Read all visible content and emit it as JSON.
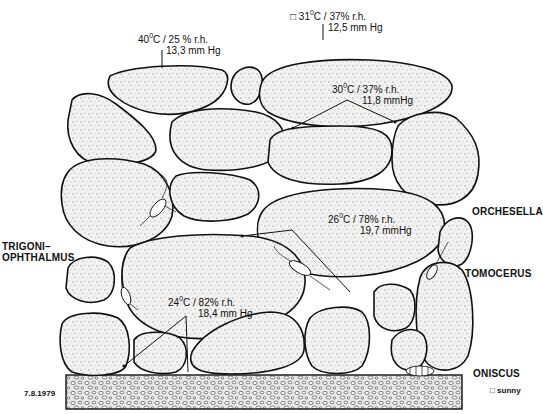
{
  "figure": {
    "type": "ecological cross-section illustration",
    "date_label": "7.8.1979",
    "legend": {
      "symbol": "□",
      "label": "sunny"
    }
  },
  "measurements": [
    {
      "id": "m1",
      "temp": "40",
      "unit": "C",
      "rh": "25",
      "vapor": "13,3 mm Hg",
      "line1": "40°C / 25 % r.h.",
      "marker": ""
    },
    {
      "id": "m2",
      "temp": "31",
      "unit": "C",
      "rh": "37",
      "vapor": "12,5 mm Hg",
      "line1": "31°C / 37% r.h.",
      "marker": "□"
    },
    {
      "id": "m3",
      "temp": "30",
      "unit": "C",
      "rh": "37",
      "vapor": "11,8 mmHg",
      "line1": "30°C / 37% r.h.",
      "marker": ""
    },
    {
      "id": "m4",
      "temp": "26",
      "unit": "C",
      "rh": "78",
      "vapor": "19,7 mmHg",
      "line1": "26°C / 78% r.h.",
      "marker": ""
    },
    {
      "id": "m5",
      "temp": "24",
      "unit": "C",
      "rh": "82",
      "vapor": "18,4 mm Hg",
      "line1": "24°C / 82% r.h.",
      "marker": ""
    }
  ],
  "labels": {
    "m1": {
      "t": "40",
      "rest": "C / 25 % r.h.",
      "vapor": "13,3 mm Hg"
    },
    "m2": {
      "marker": "□",
      "t": "31",
      "rest": "C / 37% r.h.",
      "vapor": "12,5 mm Hg"
    },
    "m3": {
      "t": "30",
      "rest": "C / 37% r.h.",
      "vapor": "11,8 mmHg"
    },
    "m4": {
      "t": "26",
      "rest": "C / 78% r.h.",
      "vapor": "19,7 mmHg"
    },
    "m5": {
      "t": "24",
      "rest": "C / 82% r.h.",
      "vapor": "18,4 mm Hg"
    },
    "degree": "0"
  },
  "species": {
    "trigonophthalmus_1": "TRIGONI–",
    "trigonophthalmus_2": "OPHTHALMUS",
    "orchesella": "ORCHESELLA",
    "tomocerus": "TOMOCERUS",
    "oniscus": "ONISCUS"
  },
  "colors": {
    "ink": "#111111",
    "background": "#ffffff"
  }
}
